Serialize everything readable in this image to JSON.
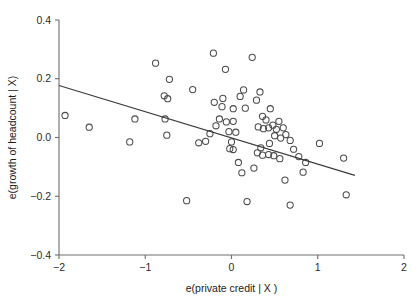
{
  "chart_data": {
    "type": "scatter",
    "title": "",
    "xlabel": "e(private credit | X )",
    "ylabel": "e(growth of headcount | X)",
    "xlim": [
      -2,
      2
    ],
    "ylim": [
      -0.4,
      0.4
    ],
    "xticks": [
      -2,
      -1,
      0,
      1,
      2
    ],
    "xticklabels": [
      "−2",
      "−1",
      "0",
      "1",
      "2"
    ],
    "yticks": [
      -0.4,
      -0.2,
      0.0,
      0.2,
      0.4
    ],
    "yticklabels": [
      "−0.4",
      "−0.2",
      "0.0",
      "0.2",
      "0.4"
    ],
    "grid": false,
    "legend": null,
    "marker_style": "open-circle",
    "marker_color": "#4a4a4a",
    "line_color": "#3a3a3a",
    "series": [
      {
        "name": "observations",
        "points": [
          [
            -1.93,
            0.075
          ],
          [
            -1.65,
            0.035
          ],
          [
            -1.12,
            0.063
          ],
          [
            -0.88,
            0.253
          ],
          [
            -0.72,
            0.198
          ],
          [
            -0.78,
            0.142
          ],
          [
            -0.74,
            0.132
          ],
          [
            -0.77,
            0.063
          ],
          [
            -0.75,
            0.008
          ],
          [
            -0.45,
            0.163
          ],
          [
            -0.38,
            -0.018
          ],
          [
            -0.21,
            0.287
          ],
          [
            -0.07,
            0.232
          ],
          [
            -0.1,
            0.133
          ],
          [
            -0.11,
            0.105
          ],
          [
            -0.2,
            0.12
          ],
          [
            -0.14,
            0.063
          ],
          [
            -0.18,
            0.04
          ],
          [
            -0.25,
            0.013
          ],
          [
            -0.3,
            -0.013
          ],
          [
            -0.06,
            0.053
          ],
          [
            -0.03,
            0.02
          ],
          [
            0.02,
            0.098
          ],
          [
            0.02,
            0.055
          ],
          [
            0.05,
            0.018
          ],
          [
            0.0,
            -0.015
          ],
          [
            -0.02,
            -0.038
          ],
          [
            0.02,
            -0.041
          ],
          [
            0.1,
            0.14
          ],
          [
            0.14,
            0.162
          ],
          [
            0.16,
            0.1
          ],
          [
            0.24,
            0.273
          ],
          [
            0.29,
            0.127
          ],
          [
            0.33,
            0.155
          ],
          [
            0.36,
            0.072
          ],
          [
            0.4,
            0.06
          ],
          [
            0.45,
            0.098
          ],
          [
            0.31,
            0.036
          ],
          [
            0.37,
            0.03
          ],
          [
            0.43,
            0.033
          ],
          [
            0.48,
            0.042
          ],
          [
            0.52,
            0.028
          ],
          [
            0.55,
            0.055
          ],
          [
            0.6,
            0.033
          ],
          [
            0.5,
            0.006
          ],
          [
            0.57,
            -0.002
          ],
          [
            0.63,
            0.01
          ],
          [
            0.68,
            -0.01
          ],
          [
            0.44,
            -0.02
          ],
          [
            0.34,
            -0.035
          ],
          [
            0.3,
            -0.052
          ],
          [
            0.36,
            -0.06
          ],
          [
            0.43,
            -0.058
          ],
          [
            0.49,
            -0.062
          ],
          [
            0.56,
            -0.072
          ],
          [
            0.72,
            -0.04
          ],
          [
            0.78,
            -0.065
          ],
          [
            0.86,
            -0.085
          ],
          [
            0.83,
            -0.118
          ],
          [
            0.26,
            -0.104
          ],
          [
            0.62,
            -0.145
          ],
          [
            0.68,
            -0.23
          ],
          [
            1.02,
            -0.02
          ],
          [
            1.3,
            -0.07
          ],
          [
            1.33,
            -0.195
          ],
          [
            -0.52,
            -0.215
          ],
          [
            0.18,
            -0.218
          ],
          [
            -1.18,
            -0.015
          ],
          [
            0.08,
            -0.085
          ],
          [
            0.12,
            -0.12
          ]
        ]
      }
    ],
    "fit_line": {
      "name": "linear fit",
      "x1": -2.0,
      "y1": 0.177,
      "x2": 1.43,
      "y2": -0.129
    }
  }
}
